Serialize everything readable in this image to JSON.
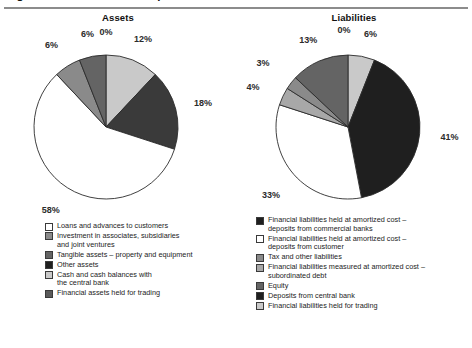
{
  "document": {
    "cut_off_heading": "Figure: Balance sheet composition",
    "divider_color": "#8c8c8c"
  },
  "palette": {
    "white": "#ffffff",
    "light": "#c9c9c9",
    "light_mid": "#a8a8a8",
    "mid": "#8a8a8a",
    "mid_dark": "#646464",
    "dark": "#3a3a3a",
    "black": "#1f1f1f",
    "stroke": "#2b2b2b",
    "label": "#2b2b2b"
  },
  "charts": {
    "assets": {
      "title": "Assets",
      "legend": [
        {
          "label": "Loans and advances to customers",
          "color": "#ffffff"
        },
        {
          "label": "Investment in associates, subsidiaries\nand joint ventures",
          "color": "#8a8a8a"
        },
        {
          "label": "Tangible assets – property and equipment",
          "color": "#646464"
        },
        {
          "label": "Other assets",
          "color": "#1f1f1f"
        },
        {
          "label": "Cash and cash balances with\nthe central bank",
          "color": "#c9c9c9"
        },
        {
          "label": "Financial assets held for trading",
          "color": "#5a5a5a"
        }
      ]
    },
    "liabilities": {
      "title": "Liabilities",
      "legend": [
        {
          "label": "Financial liabilities held at amortized cost –\ndeposits from commercial banks",
          "color": "#1f1f1f"
        },
        {
          "label": "Financial liabilities held at amortized cost –\ndeposits from customer",
          "color": "#ffffff"
        },
        {
          "label": "Tax and other liabilities",
          "color": "#8a8a8a"
        },
        {
          "label": "Financial liabilities measured at amortized cost –\nsubordinated debt",
          "color": "#a8a8a8"
        },
        {
          "label": "Equity",
          "color": "#646464"
        },
        {
          "label": "Deposits from central bank",
          "color": "#1f1f1f"
        },
        {
          "label": "Financial liabilities held for trading",
          "color": "#c9c9c9"
        }
      ]
    }
  },
  "chart_data": [
    {
      "type": "pie",
      "title": "Assets",
      "unit": "percent",
      "start_angle_deg": 0,
      "direction": "clockwise",
      "categories": [
        "Other assets",
        "Cash and cash balances with the central bank",
        "Financial assets held for trading",
        "Loans and advances to customers",
        "Investment in associates, subsidiaries and joint ventures",
        "Tangible assets – property and equipment"
      ],
      "values": [
        0,
        12,
        18,
        58,
        6,
        6
      ],
      "labels": [
        "0%",
        "12%",
        "18%",
        "58%",
        "6%",
        "6%"
      ],
      "colors": [
        "#1f1f1f",
        "#c9c9c9",
        "#3a3a3a",
        "#ffffff",
        "#8a8a8a",
        "#646464"
      ],
      "legend_position": "below",
      "grid": false
    },
    {
      "type": "pie",
      "title": "Liabilities",
      "unit": "percent",
      "start_angle_deg": 0,
      "direction": "clockwise",
      "categories": [
        "Deposits from central bank",
        "Financial liabilities held for trading",
        "Financial liabilities held at amortized cost – deposits from commercial banks",
        "Financial liabilities held at amortized cost – deposits from customer",
        "Financial liabilities measured at amortized cost – subordinated debt",
        "Tax and other liabilities",
        "Equity"
      ],
      "values": [
        0,
        6,
        41,
        33,
        4,
        3,
        13
      ],
      "labels": [
        "0%",
        "6%",
        "41%",
        "33%",
        "4%",
        "3%",
        "13%"
      ],
      "colors": [
        "#1f1f1f",
        "#c9c9c9",
        "#1f1f1f",
        "#ffffff",
        "#a8a8a8",
        "#8a8a8a",
        "#646464"
      ],
      "legend_position": "below",
      "grid": false
    }
  ],
  "value_labels": {
    "assets": [
      "0%",
      "12%",
      "18%",
      "58%",
      "6%",
      "6%"
    ],
    "liabilities": [
      "0%",
      "6%",
      "41%",
      "33%",
      "4%",
      "3%",
      "13%"
    ]
  }
}
